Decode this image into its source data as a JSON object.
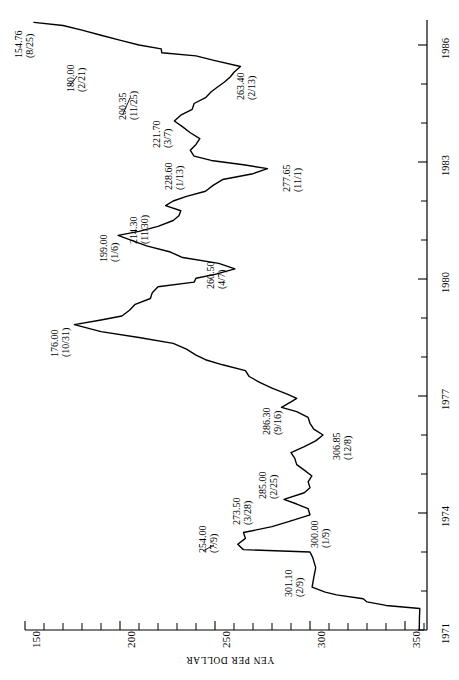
{
  "chart_data": {
    "type": "line",
    "title": "",
    "xlabel": "YEN PER DOLLAR",
    "ylabel": "",
    "orientation": "rotated-90",
    "grid": false,
    "legend": null,
    "value_axis": {
      "name": "YEN PER DOLLAR",
      "min": 150,
      "max": 360,
      "tick_step_minor": 10,
      "tick_step_major": 50,
      "tick_labels": [
        "150",
        "200",
        "250",
        "300",
        "350"
      ],
      "tick_values": [
        150,
        200,
        250,
        300,
        350
      ]
    },
    "time_axis": {
      "name": "",
      "min": 1971,
      "max": 1986.6,
      "tick_step": 1,
      "tick_labels": [
        "1971",
        "1974",
        "1977",
        "1980",
        "1983",
        "1986"
      ],
      "tick_values": [
        1971,
        1974,
        1977,
        1980,
        1983,
        1986
      ]
    },
    "series": [
      {
        "name": "Yen per Dollar",
        "x": [
          1971.0,
          1971.3,
          1971.55,
          1971.63,
          1971.72,
          1971.8,
          1971.9,
          1971.97,
          1972.1,
          1972.35,
          1972.6,
          1972.85,
          1973.0,
          1973.06,
          1973.1,
          1973.2,
          1973.35,
          1973.5,
          1973.65,
          1973.8,
          1973.95,
          1974.11,
          1974.23,
          1974.35,
          1974.52,
          1974.65,
          1974.8,
          1974.95,
          1975.1,
          1975.24,
          1975.4,
          1975.55,
          1975.7,
          1975.85,
          1976.0,
          1976.15,
          1976.3,
          1976.45,
          1976.6,
          1976.71,
          1976.85,
          1976.94,
          1977.05,
          1977.2,
          1977.35,
          1977.5,
          1977.65,
          1977.8,
          1977.93,
          1978.05,
          1978.2,
          1978.35,
          1978.5,
          1978.65,
          1978.83,
          1978.95,
          1979.05,
          1979.2,
          1979.35,
          1979.5,
          1979.65,
          1979.8,
          1979.92,
          1980.02,
          1980.12,
          1980.26,
          1980.4,
          1980.55,
          1980.7,
          1980.85,
          1981.01,
          1981.12,
          1981.22,
          1981.35,
          1981.5,
          1981.62,
          1981.75,
          1981.88,
          1982.0,
          1982.12,
          1982.25,
          1982.4,
          1982.55,
          1982.7,
          1982.83,
          1982.93,
          1983.04,
          1983.15,
          1983.3,
          1983.45,
          1983.6,
          1983.75,
          1983.9,
          1984.05,
          1984.2,
          1984.35,
          1984.5,
          1984.65,
          1984.8,
          1984.91,
          1985.05,
          1985.18,
          1985.3,
          1985.45,
          1985.6,
          1985.72,
          1985.8,
          1985.9,
          1986.0,
          1986.12,
          1986.25,
          1986.38,
          1986.5,
          1986.58
        ],
        "y": [
          357.5,
          357.6,
          357.8,
          340.0,
          330.0,
          328.0,
          314.0,
          308.0,
          301.1,
          302.0,
          303.0,
          301.5,
          300.0,
          265.0,
          264.0,
          262.0,
          266.0,
          265.0,
          280.0,
          290.0,
          300.0,
          299.0,
          293.0,
          286.3,
          297.0,
          300.0,
          299.0,
          301.0,
          297.0,
          293.0,
          292.0,
          290.0,
          297.0,
          303.0,
          306.85,
          302.0,
          300.0,
          299.0,
          293.0,
          285.0,
          290.0,
          293.0,
          288.0,
          280.0,
          273.5,
          268.0,
          266.0,
          254.0,
          245.0,
          240.0,
          235.0,
          228.0,
          210.0,
          190.0,
          176.0,
          190.0,
          201.0,
          205.0,
          208.0,
          216.0,
          217.0,
          220.0,
          239.0,
          240.0,
          250.0,
          260.5,
          252.0,
          233.0,
          226.0,
          214.0,
          205.0,
          199.0,
          210.0,
          220.0,
          228.0,
          231.0,
          232.0,
          224.0,
          228.0,
          235.0,
          245.0,
          249.0,
          254.0,
          270.0,
          277.65,
          265.0,
          248.0,
          239.0,
          237.0,
          240.0,
          242.0,
          237.0,
          233.0,
          228.6,
          232.0,
          238.0,
          239.0,
          245.0,
          248.0,
          251.0,
          255.0,
          258.0,
          260.0,
          263.4,
          250.0,
          240.0,
          222.0,
          221.7,
          210.0,
          200.35,
          190.0,
          180.0,
          170.0,
          154.76
        ]
      }
    ],
    "annotations": [
      {
        "value": "154.76",
        "date": "(8/25)",
        "x_year": 1986.58,
        "y_value": 154.76
      },
      {
        "value": "180.00",
        "date": "(2/21)",
        "x_year": 1986.12,
        "y_value": 180.0
      },
      {
        "value": "200.35",
        "date": "(11/25)",
        "x_year": 1985.9,
        "y_value": 200.35
      },
      {
        "value": "221.70",
        "date": "(3/7)",
        "x_year": 1985.18,
        "y_value": 221.7
      },
      {
        "value": "263.40",
        "date": "(2/13)",
        "x_year": 1985.12,
        "y_value": 263.4
      },
      {
        "value": "228.60",
        "date": "(1/13)",
        "x_year": 1984.04,
        "y_value": 228.6
      },
      {
        "value": "277.65",
        "date": "(11/1)",
        "x_year": 1982.83,
        "y_value": 277.65
      },
      {
        "value": "214.30",
        "date": "(11/30)",
        "x_year": 1980.91,
        "y_value": 214.3
      },
      {
        "value": "199.00",
        "date": "(1/6)",
        "x_year": 1981.02,
        "y_value": 199.0
      },
      {
        "value": "260.50",
        "date": "(4/7)",
        "x_year": 1980.26,
        "y_value": 260.5
      },
      {
        "value": "176.00",
        "date": "(10/31)",
        "x_year": 1978.83,
        "y_value": 176.0
      },
      {
        "value": "286.30",
        "date": "(9/16)",
        "x_year": 1974.71,
        "y_value": 286.3
      },
      {
        "value": "306.85",
        "date": "(12/8)",
        "x_year": 1975.94,
        "y_value": 306.85
      },
      {
        "value": "285.00",
        "date": "(2/25)",
        "x_year": 1976.15,
        "y_value": 285.0
      },
      {
        "value": "273.50",
        "date": "(3/28)",
        "x_year": 1977.24,
        "y_value": 273.5
      },
      {
        "value": "254.00",
        "date": "(7/9)",
        "x_year": 1977.52,
        "y_value": 254.0
      },
      {
        "value": "300.00",
        "date": "(1/9)",
        "x_year": 1973.02,
        "y_value": 300.0
      },
      {
        "value": "301.10",
        "date": "(2/9)",
        "x_year": 1972.11,
        "y_value": 301.1
      }
    ]
  },
  "layout": {
    "value_axis_pixel": {
      "x_at_min": 25,
      "x_at_max": 424,
      "min": 150,
      "max": 360
    },
    "time_axis_pixel": {
      "y_at_1971": 630,
      "y_at_1986": 45,
      "axis_x": 427,
      "axis_top": 20
    },
    "annotation_positions": [
      {
        "x": 14,
        "y": 58
      },
      {
        "x": 66,
        "y": 92
      },
      {
        "x": 118,
        "y": 120
      },
      {
        "x": 152,
        "y": 148
      },
      {
        "x": 236,
        "y": 100
      },
      {
        "x": 164,
        "y": 190
      },
      {
        "x": 282,
        "y": 192
      },
      {
        "x": 129,
        "y": 244
      },
      {
        "x": 99,
        "y": 262
      },
      {
        "x": 206,
        "y": 289
      },
      {
        "x": 50,
        "y": 357
      },
      {
        "x": 262,
        "y": 435
      },
      {
        "x": 332,
        "y": 460
      },
      {
        "x": 258,
        "y": 499
      },
      {
        "x": 232,
        "y": 525
      },
      {
        "x": 198,
        "y": 553
      },
      {
        "x": 310,
        "y": 548
      },
      {
        "x": 284,
        "y": 597
      }
    ],
    "leaders": [
      {
        "x1": 70,
        "y1": 86,
        "x2": 77,
        "y2": 76
      },
      {
        "x1": 123,
        "y1": 114,
        "x2": 130,
        "y2": 98
      },
      {
        "x1": 203,
        "y1": 551,
        "x2": 214,
        "y2": 545
      }
    ]
  }
}
